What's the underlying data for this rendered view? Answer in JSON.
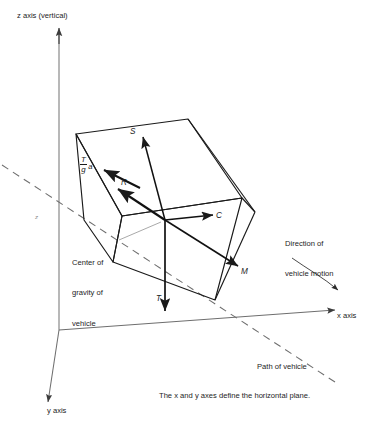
{
  "figure": {
    "caption": "The x and y axes define the horizontal plane.",
    "axes": {
      "z_label": "z axis (vertical)",
      "z_label_italic": "z",
      "z_label_rest": " axis (vertical)",
      "x_label_italic": "x",
      "x_label_rest": " axis",
      "y_label_italic": "y",
      "y_label_rest": " axis",
      "origin_marker": "z"
    },
    "annotations": {
      "center_of_gravity": "Center of\ngravity of\nvehicle",
      "center_of_gravity_line1": "Center of",
      "center_of_gravity_line2": "gravity of",
      "center_of_gravity_line3": "vehicle",
      "direction_line1": "Direction of",
      "direction_line2": "vehicle motion",
      "path_of_vehicle": "Path of vehicle"
    },
    "vectors": [
      {
        "name": "S",
        "label": "S"
      },
      {
        "name": "C",
        "label": "C"
      },
      {
        "name": "M",
        "label": "M"
      },
      {
        "name": "T",
        "label": "T"
      },
      {
        "name": "R",
        "label": "R"
      },
      {
        "name": "inertia",
        "numerator": "T",
        "denominator": "g",
        "suffix": "a"
      }
    ],
    "colors": {
      "ink": "#1a1a1a",
      "axis": "#565656",
      "dash": "#6e6e6e",
      "leader": "#8d8d8d",
      "background": "#ffffff"
    }
  }
}
